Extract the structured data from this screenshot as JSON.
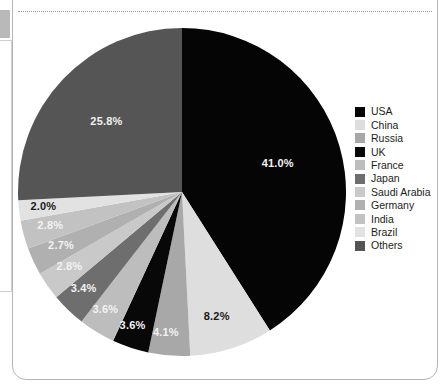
{
  "panel": {
    "separator_style": "dotted"
  },
  "chart_data": {
    "type": "pie",
    "title": "",
    "subtitle": "",
    "xlabel": "",
    "ylabel": "",
    "legend_position": "right",
    "grid": false,
    "start_angle_deg": 0,
    "direction": "clockwise",
    "value_unit": "%",
    "categories": [
      "USA",
      "China",
      "Russia",
      "UK",
      "France",
      "Japan",
      "Saudi Arabia",
      "Germany",
      "India",
      "Brazil",
      "Others"
    ],
    "values": [
      41.0,
      8.2,
      4.1,
      3.6,
      3.6,
      3.4,
      2.8,
      2.7,
      2.8,
      2.0,
      25.8
    ],
    "data_labels": [
      "41.0%",
      "8.2%",
      "4.1%",
      "3.6%",
      "3.6%",
      "3.4%",
      "2.8%",
      "2.7%",
      "2.8%",
      "2.0%",
      "25.8%"
    ],
    "colors": [
      "#050505",
      "#dedede",
      "#a8a8a8",
      "#080808",
      "#bdbdbd",
      "#6e6e6e",
      "#c9c9c9",
      "#b0b0b0",
      "#c2c2c2",
      "#e2e2e2",
      "#555555"
    ],
    "label_text_colors": [
      "light",
      "dark",
      "light",
      "light",
      "light",
      "light",
      "light",
      "light",
      "light",
      "dark",
      "light"
    ]
  },
  "legend": {
    "items": [
      {
        "label": "USA",
        "color": "#050505"
      },
      {
        "label": "China",
        "color": "#dedede"
      },
      {
        "label": "Russia",
        "color": "#a8a8a8"
      },
      {
        "label": "UK",
        "color": "#080808"
      },
      {
        "label": "France",
        "color": "#bdbdbd"
      },
      {
        "label": "Japan",
        "color": "#6e6e6e"
      },
      {
        "label": "Saudi Arabia",
        "color": "#c9c9c9"
      },
      {
        "label": "Germany",
        "color": "#b0b0b0"
      },
      {
        "label": "India",
        "color": "#c2c2c2"
      },
      {
        "label": "Brazil",
        "color": "#e2e2e2"
      },
      {
        "label": "Others",
        "color": "#555555"
      }
    ]
  }
}
